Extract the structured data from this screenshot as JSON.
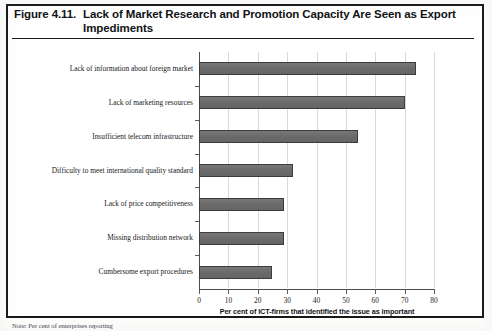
{
  "figure": {
    "number": "Figure 4.11.",
    "title": "Lack of Market Research and Promotion Capacity Are Seen as Export Impediments",
    "note": "Note: Per cent of enterprises reporting"
  },
  "chart_data": {
    "type": "bar",
    "orientation": "horizontal",
    "title": "Lack of Market Research and Promotion Capacity Are Seen as Export Impediments",
    "categories": [
      "Lack of information about foreign market",
      "Lack of marketing resources",
      "Insufficient telecom infrastructure",
      "Difficulty to meet international quality standard",
      "Lack of price competitiveness",
      "Missing distribution network",
      "Cumbersome export procedures"
    ],
    "values": [
      74,
      70,
      54,
      32,
      29,
      29,
      25
    ],
    "xlabel": "Per cent of ICT-firms that identified the issue as important",
    "ylabel": "",
    "xlim": [
      0,
      80
    ],
    "xticks": [
      0,
      10,
      20,
      30,
      40,
      50,
      60,
      70,
      80
    ],
    "xtick_labels": [
      "0",
      "10",
      "20",
      "30",
      "40",
      "50",
      "60",
      "70",
      "80"
    ],
    "grid": true,
    "grid_axis": "x",
    "legend": false,
    "bar_color": "#6e6e6e",
    "bar_border_color": "#3c3c3c",
    "grid_color": "#d9d9d9",
    "axis_color": "#4a4c4e"
  }
}
